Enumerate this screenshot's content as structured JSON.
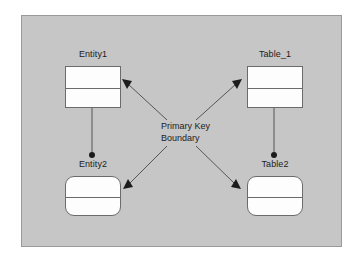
{
  "diagram": {
    "canvas": {
      "background_color": "#c6c6c6",
      "border_color": "#9a9a9a"
    },
    "center_annotation": {
      "line1": "Primary Key",
      "line2": "Boundary"
    },
    "entities": [
      {
        "id": "entity1",
        "label": "Entity1",
        "shape": "rectangle",
        "corner": "sharp",
        "x": 65,
        "y": 66,
        "width": 56,
        "height": 42,
        "divider_y": 21,
        "label_x": 65,
        "label_y": 50
      },
      {
        "id": "table_1",
        "label": "Table_1",
        "shape": "rectangle",
        "corner": "sharp",
        "x": 247,
        "y": 66,
        "width": 56,
        "height": 42,
        "divider_y": 21,
        "label_x": 247,
        "label_y": 50
      },
      {
        "id": "entity2",
        "label": "Entity2",
        "shape": "rounded-rectangle",
        "corner": "rounded",
        "x": 65,
        "y": 176,
        "width": 56,
        "height": 40,
        "divider_y": 20,
        "label_x": 65,
        "label_y": 160
      },
      {
        "id": "table2",
        "label": "Table2",
        "shape": "rounded-rectangle",
        "corner": "rounded",
        "x": 247,
        "y": 176,
        "width": 56,
        "height": 40,
        "divider_y": 20,
        "label_x": 247,
        "label_y": 160
      }
    ],
    "connectors": [
      {
        "id": "connector-center-to-entity1",
        "from": "center",
        "to": "entity1",
        "style": "arrow",
        "endpoint_marker": "filled-triangle"
      },
      {
        "id": "connector-center-to-table_1",
        "from": "center",
        "to": "table_1",
        "style": "arrow",
        "endpoint_marker": "filled-triangle"
      },
      {
        "id": "connector-center-to-entity2",
        "from": "center",
        "to": "entity2",
        "style": "arrow",
        "endpoint_marker": "filled-triangle"
      },
      {
        "id": "connector-center-to-table2",
        "from": "center",
        "to": "table2",
        "style": "arrow",
        "endpoint_marker": "filled-triangle"
      },
      {
        "id": "connector-entity1-to-entity2",
        "from": "entity1",
        "to": "entity2",
        "style": "line",
        "endpoint_marker": "filled-circle"
      },
      {
        "id": "connector-table_1-to-table2",
        "from": "table_1",
        "to": "table2",
        "style": "line",
        "endpoint_marker": "filled-circle"
      }
    ],
    "colors": {
      "line": "#555555",
      "box_fill": "#fdfdfd",
      "box_stroke": "#6b6b6b",
      "text": "#1c1c1c"
    }
  }
}
